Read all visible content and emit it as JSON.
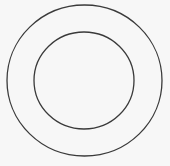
{
  "diagram": {
    "type": "concentric-circles",
    "background": "#f7f7f7",
    "stroke_color": "#3a3a3a",
    "outer_circle": {
      "cx": 84.5,
      "cy": 80.5,
      "rx": 77.5,
      "ry": 75.5
    },
    "inner_circle": {
      "cx": 84,
      "cy": 80.5,
      "rx": 50,
      "ry": 48.5
    }
  }
}
